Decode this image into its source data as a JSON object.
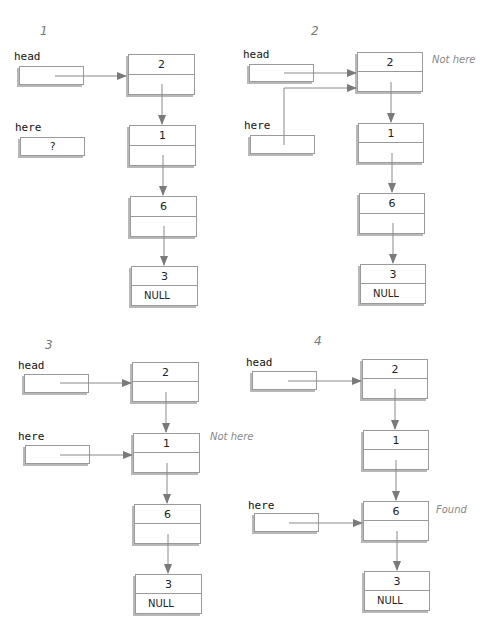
{
  "colors": {
    "line": "#8a8a8a",
    "box_border": "#9a9a9a",
    "shadow": "#b8b8b8",
    "note_text": "#888888",
    "step_text": "#777777"
  },
  "panels": [
    {
      "step": "1",
      "head_label": "head",
      "here_label": "here",
      "here_value": "?",
      "note": "",
      "nodes": [
        {
          "value": "2",
          "next": ""
        },
        {
          "value": "1",
          "next": ""
        },
        {
          "value": "6",
          "next": ""
        },
        {
          "value": "3",
          "next": "NULL"
        }
      ]
    },
    {
      "step": "2",
      "head_label": "head",
      "here_label": "here",
      "here_value": "",
      "note": "Not here",
      "nodes": [
        {
          "value": "2",
          "next": ""
        },
        {
          "value": "1",
          "next": ""
        },
        {
          "value": "6",
          "next": ""
        },
        {
          "value": "3",
          "next": "NULL"
        }
      ]
    },
    {
      "step": "3",
      "head_label": "head",
      "here_label": "here",
      "here_value": "",
      "note": "Not here",
      "nodes": [
        {
          "value": "2",
          "next": ""
        },
        {
          "value": "1",
          "next": ""
        },
        {
          "value": "6",
          "next": ""
        },
        {
          "value": "3",
          "next": "NULL"
        }
      ]
    },
    {
      "step": "4",
      "head_label": "head",
      "here_label": "here",
      "here_value": "",
      "note": "Found",
      "nodes": [
        {
          "value": "2",
          "next": ""
        },
        {
          "value": "1",
          "next": ""
        },
        {
          "value": "6",
          "next": ""
        },
        {
          "value": "3",
          "next": "NULL"
        }
      ]
    }
  ]
}
